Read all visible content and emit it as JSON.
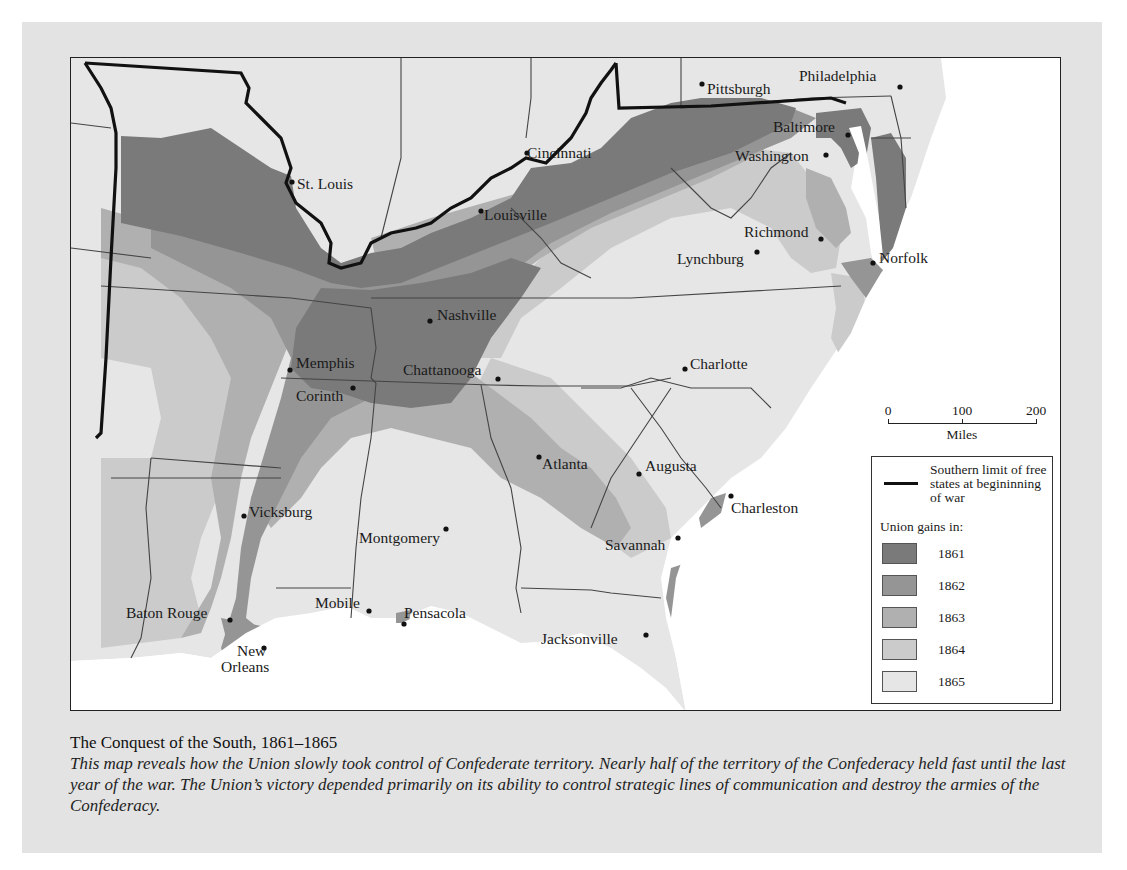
{
  "caption": {
    "title": "The Conquest of the South, 1861–1865",
    "body": "This map reveals how the Union slowly took control of Confederate territory. Nearly half of the territory of the Confederacy held fast until the last year of the war. The Union’s victory depended primarily on its ability to control strategic lines of communication and destroy the armies of the Confederacy."
  },
  "map": {
    "cities": [
      {
        "name": "Pittsburgh",
        "x": 631,
        "y": 26
      },
      {
        "name": "Philadelphia",
        "x": 829,
        "y": 29
      },
      {
        "name": "Baltimore",
        "x": 777,
        "y": 77
      },
      {
        "name": "Washington",
        "x": 755,
        "y": 97
      },
      {
        "name": "Cincinnati",
        "x": 456,
        "y": 95
      },
      {
        "name": "St. Louis",
        "x": 221,
        "y": 124
      },
      {
        "name": "Louisville",
        "x": 410,
        "y": 153
      },
      {
        "name": "Richmond",
        "x": 750,
        "y": 181
      },
      {
        "name": "Lynchburg",
        "x": 686,
        "y": 194
      },
      {
        "name": "Norfolk",
        "x": 802,
        "y": 205
      },
      {
        "name": "Nashville",
        "x": 359,
        "y": 263
      },
      {
        "name": "Memphis",
        "x": 219,
        "y": 312
      },
      {
        "name": "Chattanooga",
        "x": 427,
        "y": 321
      },
      {
        "name": "Corinth",
        "x": 282,
        "y": 330
      },
      {
        "name": "Charlotte",
        "x": 614,
        "y": 311
      },
      {
        "name": "Atlanta",
        "x": 468,
        "y": 399
      },
      {
        "name": "Augusta",
        "x": 568,
        "y": 416
      },
      {
        "name": "Charleston",
        "x": 660,
        "y": 438
      },
      {
        "name": "Vicksburg",
        "x": 173,
        "y": 458
      },
      {
        "name": "Montgomery",
        "x": 375,
        "y": 471
      },
      {
        "name": "Savannah",
        "x": 607,
        "y": 480
      },
      {
        "name": "Baton Rouge",
        "x": 159,
        "y": 562
      },
      {
        "name": "Mobile",
        "x": 298,
        "y": 553
      },
      {
        "name": "Pensacola",
        "x": 333,
        "y": 566
      },
      {
        "name": "New Orleans",
        "x": 193,
        "y": 590
      },
      {
        "name": "Jacksonville",
        "x": 575,
        "y": 577
      }
    ],
    "scale": {
      "ticks": [
        "0",
        "100",
        "200"
      ],
      "unit": "Miles"
    }
  },
  "legend": {
    "boundary_label": "Southern limit of free states at begininning of war",
    "gains_title": "Union gains in:",
    "items": [
      {
        "year": "1861",
        "color": "#7a7a7a"
      },
      {
        "year": "1862",
        "color": "#959595"
      },
      {
        "year": "1863",
        "color": "#b0b0b0"
      },
      {
        "year": "1864",
        "color": "#cbcbcb"
      },
      {
        "year": "1865",
        "color": "#e6e6e6"
      }
    ]
  }
}
